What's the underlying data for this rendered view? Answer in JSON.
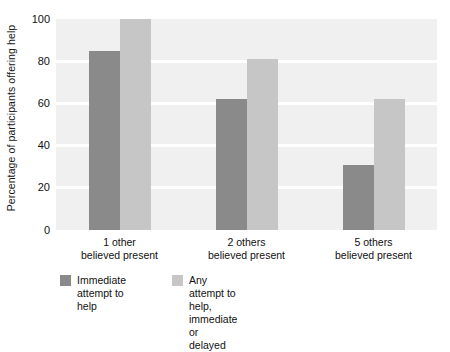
{
  "chart_data": {
    "type": "bar",
    "title": "",
    "xlabel": "",
    "ylabel": "Percentage of participants offering help",
    "ylim": [
      0,
      100
    ],
    "yticks": [
      "0",
      "20",
      "40",
      "60",
      "80",
      "100"
    ],
    "ytick_values": [
      0,
      20,
      40,
      60,
      80,
      100
    ],
    "grid": "horizontal-white-gridlines",
    "legend_position": "bottom-left",
    "categories": [
      "1 other\nbelieved present",
      "2 others\nbelieved present",
      "5 others\nbelieved present"
    ],
    "category_lines": [
      {
        "line1": "1 other",
        "line2": "believed present"
      },
      {
        "line1": "2 others",
        "line2": "believed present"
      },
      {
        "line1": "5 others",
        "line2": "believed present"
      }
    ],
    "series": [
      {
        "name": "Immediate\nattempt to help",
        "name_line1": "Immediate",
        "name_line2": "attempt to help",
        "color": "#8a8a8a",
        "values": [
          85,
          62,
          31
        ]
      },
      {
        "name": "Any attempt to help,\nimmediate or delayed",
        "name_line1": "Any attempt to help,",
        "name_line2": "immediate or delayed",
        "color": "#c6c6c6",
        "values": [
          100,
          81,
          62
        ]
      }
    ]
  },
  "colors": {
    "plot_background": "#f0f0f0",
    "gridline": "#ffffff",
    "page_background": "#ffffff",
    "text": "#111111",
    "series_dark": "#8a8a8a",
    "series_light": "#c6c6c6"
  }
}
